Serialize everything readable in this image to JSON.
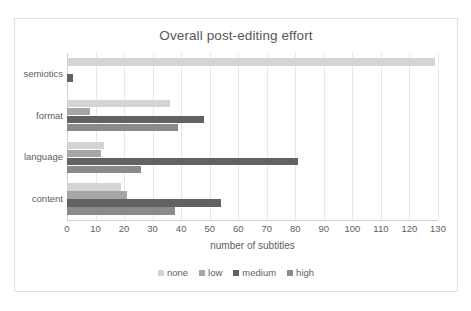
{
  "chart_data": {
    "type": "bar",
    "orientation": "horizontal",
    "title": "Overall post-editing effort",
    "xlabel": "number of subtitles",
    "ylabel": "",
    "xlim": [
      0,
      130
    ],
    "xticks": [
      0,
      10,
      20,
      30,
      40,
      50,
      60,
      70,
      80,
      90,
      100,
      110,
      120,
      130
    ],
    "grid": true,
    "legend_position": "bottom",
    "categories": [
      "semiotics",
      "format",
      "language",
      "content"
    ],
    "series": [
      {
        "name": "none",
        "color": "#d4d4d4",
        "values": [
          129,
          36,
          13,
          19
        ]
      },
      {
        "name": "low",
        "color": "#a6a6a6",
        "values": [
          0,
          8,
          12,
          21
        ]
      },
      {
        "name": "medium",
        "color": "#626262",
        "values": [
          2,
          48,
          81,
          54
        ]
      },
      {
        "name": "high",
        "color": "#8a8a8a",
        "values": [
          0,
          39,
          26,
          38
        ]
      }
    ]
  }
}
